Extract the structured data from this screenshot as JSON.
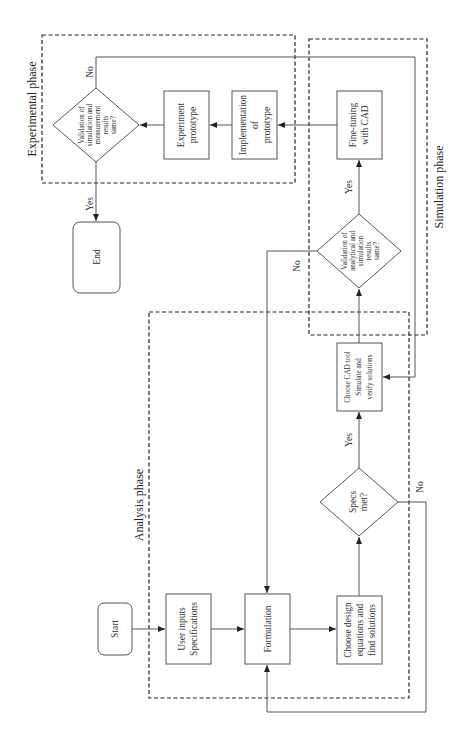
{
  "diagram": {
    "type": "flowchart",
    "orientation": "rotated-90-ccw",
    "phases": {
      "analysis": "Analysis phase",
      "simulation": "Simulation phase",
      "experimental": "Experimental phase"
    },
    "nodes": {
      "start": "Start",
      "user_inputs": [
        "User inputs",
        "Specifications"
      ],
      "formulation": "Formulation",
      "choose_design": [
        "Choose design",
        "equations and",
        "find solutions"
      ],
      "specs_met": [
        "Specs",
        "met?"
      ],
      "choose_cad": [
        "Choose CAD tool",
        "Simulate and",
        "verify solutions"
      ],
      "validation_analytical": [
        "Validation of",
        "analytical and",
        "simulation",
        "results",
        "same?"
      ],
      "fine_tuning": [
        "Fine-tuning",
        "with CAD"
      ],
      "implementation": [
        "Implementation",
        "of",
        "prototype"
      ],
      "experiment_prototype": [
        "Experiment",
        "prototype"
      ],
      "validation_measurement": [
        "Validation of",
        "simulation and",
        "measurement",
        "results",
        "same?"
      ],
      "end": "End"
    },
    "edge_labels": {
      "specs_yes": "Yes",
      "specs_no": "No",
      "val_analytical_yes": "Yes",
      "val_analytical_no": "No",
      "val_measurement_yes": "Yes",
      "val_measurement_no": "No"
    },
    "edges": [
      {
        "from": "Start",
        "to": "User inputs Specifications"
      },
      {
        "from": "User inputs Specifications",
        "to": "Formulation"
      },
      {
        "from": "Formulation",
        "to": "Choose design equations and find solutions"
      },
      {
        "from": "Choose design equations and find solutions",
        "to": "Specs met?"
      },
      {
        "from": "Specs met?",
        "to": "Choose CAD tool Simulate and verify solutions",
        "label": "Yes"
      },
      {
        "from": "Specs met?",
        "to": "Formulation",
        "label": "No"
      },
      {
        "from": "Choose CAD tool Simulate and verify solutions",
        "to": "Validation of analytical and simulation results same?"
      },
      {
        "from": "Validation of analytical and simulation results same?",
        "to": "Fine-tuning with CAD",
        "label": "Yes"
      },
      {
        "from": "Validation of analytical and simulation results same?",
        "to": "Formulation",
        "label": "No"
      },
      {
        "from": "Fine-tuning with CAD",
        "to": "Implementation of prototype"
      },
      {
        "from": "Implementation of prototype",
        "to": "Experiment prototype"
      },
      {
        "from": "Experiment prototype",
        "to": "Validation of simulation and measurement results same?"
      },
      {
        "from": "Validation of simulation and measurement results same?",
        "to": "End",
        "label": "Yes"
      },
      {
        "from": "Validation of simulation and measurement results same?",
        "to": "Choose CAD tool Simulate and verify solutions",
        "label": "No"
      }
    ]
  }
}
